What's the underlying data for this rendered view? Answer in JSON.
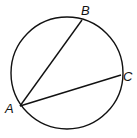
{
  "diagram": {
    "type": "circle-with-chords",
    "circle": {
      "cx": 67,
      "cy": 73,
      "r": 56
    },
    "points": [
      {
        "id": "A",
        "label": "A",
        "x": 20,
        "y": 106,
        "lx": 5,
        "ly": 113
      },
      {
        "id": "B",
        "label": "B",
        "x": 82,
        "y": 20,
        "lx": 81,
        "ly": 15
      },
      {
        "id": "C",
        "label": "C",
        "x": 121,
        "y": 75,
        "lx": 123,
        "ly": 81
      }
    ],
    "chords": [
      {
        "from": "A",
        "to": "B"
      },
      {
        "from": "A",
        "to": "C"
      }
    ],
    "stroke_color": "#111111"
  }
}
